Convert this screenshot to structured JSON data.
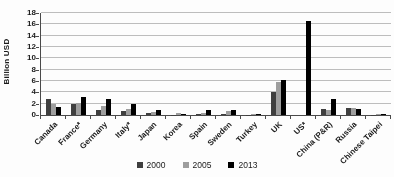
{
  "chart_data": {
    "type": "bar",
    "title": "",
    "ylabel": "Billion USD",
    "xlabel": "",
    "ylim": [
      0,
      18
    ],
    "ytick_step": 2,
    "grid": "horizontal",
    "legend_position": "bottom-center",
    "categories": [
      "Canada",
      "France*",
      "Germany",
      "Italy*",
      "Japan",
      "Korea",
      "Spain",
      "Sweden",
      "Turkey",
      "UK",
      "US*",
      "China (P&R)",
      "Russia",
      "Chinese Taipei"
    ],
    "series": [
      {
        "name": "2000",
        "color": "#3f3f3f",
        "values": [
          2.9,
          1.9,
          0.8,
          0.7,
          0.4,
          0.05,
          0.1,
          0.15,
          0.05,
          4.1,
          0,
          1.0,
          1.2,
          0.05
        ]
      },
      {
        "name": "2005",
        "color": "#9e9e9e",
        "values": [
          2.0,
          2.2,
          1.6,
          1.1,
          0.5,
          0.3,
          0.4,
          0.7,
          0.1,
          5.8,
          0,
          0.8,
          1.3,
          0.1
        ]
      },
      {
        "name": "2013",
        "color": "#000000",
        "values": [
          1.4,
          3.2,
          2.9,
          2.0,
          0.9,
          0.1,
          0.9,
          0.8,
          0.1,
          6.1,
          16.6,
          2.9,
          1.0,
          0.1
        ]
      }
    ],
    "colors": {
      "axis": "#4a4a4a",
      "gridline": "#bdbdbd",
      "text": "#1a1a1a"
    }
  }
}
